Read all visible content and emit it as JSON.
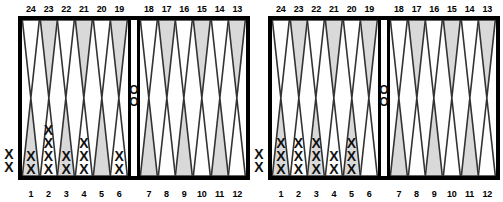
{
  "page": {
    "checker_glyphs": {
      "player_x": "X",
      "player_o": "O"
    },
    "colors": {
      "border": "#000000",
      "background": "#ffffff",
      "point_shaded": "#d9d9d9",
      "point_plain": "#ffffff",
      "point_outline": "#333333",
      "text": "#000000"
    }
  },
  "boards": [
    {
      "id": "board-left",
      "top_numbers": [
        "24",
        "23",
        "22",
        "21",
        "20",
        "19",
        "18",
        "17",
        "16",
        "15",
        "14",
        "13"
      ],
      "bottom_numbers": [
        "1",
        "2",
        "3",
        "4",
        "5",
        "6",
        "7",
        "8",
        "9",
        "10",
        "11",
        "12"
      ],
      "top_left_quadrant": [
        {
          "point": "24",
          "shaded": false,
          "checkers": 0,
          "player": ""
        },
        {
          "point": "23",
          "shaded": true,
          "checkers": 0,
          "player": ""
        },
        {
          "point": "22",
          "shaded": false,
          "checkers": 0,
          "player": ""
        },
        {
          "point": "21",
          "shaded": true,
          "checkers": 0,
          "player": ""
        },
        {
          "point": "20",
          "shaded": false,
          "checkers": 0,
          "player": ""
        },
        {
          "point": "19",
          "shaded": true,
          "checkers": 0,
          "player": ""
        }
      ],
      "top_right_quadrant": [
        {
          "point": "18",
          "shaded": false,
          "checkers": 0,
          "player": ""
        },
        {
          "point": "17",
          "shaded": true,
          "checkers": 0,
          "player": ""
        },
        {
          "point": "16",
          "shaded": false,
          "checkers": 0,
          "player": ""
        },
        {
          "point": "15",
          "shaded": true,
          "checkers": 0,
          "player": ""
        },
        {
          "point": "14",
          "shaded": false,
          "checkers": 0,
          "player": ""
        },
        {
          "point": "13",
          "shaded": true,
          "checkers": 0,
          "player": ""
        }
      ],
      "bottom_left_quadrant": [
        {
          "point": "1",
          "shaded": true,
          "checkers": 2,
          "player": "X"
        },
        {
          "point": "2",
          "shaded": false,
          "checkers": 4,
          "player": "X"
        },
        {
          "point": "3",
          "shaded": true,
          "checkers": 2,
          "player": "X"
        },
        {
          "point": "4",
          "shaded": false,
          "checkers": 3,
          "player": "X"
        },
        {
          "point": "5",
          "shaded": true,
          "checkers": 0,
          "player": ""
        },
        {
          "point": "6",
          "shaded": false,
          "checkers": 2,
          "player": "X"
        }
      ],
      "bottom_right_quadrant": [
        {
          "point": "7",
          "shaded": true,
          "checkers": 0,
          "player": ""
        },
        {
          "point": "8",
          "shaded": false,
          "checkers": 0,
          "player": ""
        },
        {
          "point": "9",
          "shaded": true,
          "checkers": 0,
          "player": ""
        },
        {
          "point": "10",
          "shaded": false,
          "checkers": 0,
          "player": ""
        },
        {
          "point": "11",
          "shaded": true,
          "checkers": 0,
          "player": ""
        },
        {
          "point": "12",
          "shaded": false,
          "checkers": 0,
          "player": ""
        }
      ],
      "bar": {
        "player": "O",
        "checkers": 2
      },
      "borne_off": {
        "player": "X",
        "checkers": 2
      }
    },
    {
      "id": "board-right",
      "top_numbers": [
        "24",
        "23",
        "22",
        "21",
        "20",
        "19",
        "18",
        "17",
        "16",
        "15",
        "14",
        "13"
      ],
      "bottom_numbers": [
        "1",
        "2",
        "3",
        "4",
        "5",
        "6",
        "7",
        "8",
        "9",
        "10",
        "11",
        "12"
      ],
      "top_left_quadrant": [
        {
          "point": "24",
          "shaded": false,
          "checkers": 0,
          "player": ""
        },
        {
          "point": "23",
          "shaded": true,
          "checkers": 0,
          "player": ""
        },
        {
          "point": "22",
          "shaded": false,
          "checkers": 0,
          "player": ""
        },
        {
          "point": "21",
          "shaded": true,
          "checkers": 0,
          "player": ""
        },
        {
          "point": "20",
          "shaded": false,
          "checkers": 0,
          "player": ""
        },
        {
          "point": "19",
          "shaded": true,
          "checkers": 0,
          "player": ""
        }
      ],
      "top_right_quadrant": [
        {
          "point": "18",
          "shaded": false,
          "checkers": 0,
          "player": ""
        },
        {
          "point": "17",
          "shaded": true,
          "checkers": 0,
          "player": ""
        },
        {
          "point": "16",
          "shaded": false,
          "checkers": 0,
          "player": ""
        },
        {
          "point": "15",
          "shaded": true,
          "checkers": 0,
          "player": ""
        },
        {
          "point": "14",
          "shaded": false,
          "checkers": 0,
          "player": ""
        },
        {
          "point": "13",
          "shaded": true,
          "checkers": 0,
          "player": ""
        }
      ],
      "bottom_left_quadrant": [
        {
          "point": "1",
          "shaded": true,
          "checkers": 3,
          "player": "X"
        },
        {
          "point": "2",
          "shaded": false,
          "checkers": 3,
          "player": "X"
        },
        {
          "point": "3",
          "shaded": true,
          "checkers": 3,
          "player": "X"
        },
        {
          "point": "4",
          "shaded": false,
          "checkers": 2,
          "player": "X"
        },
        {
          "point": "5",
          "shaded": true,
          "checkers": 3,
          "player": "X"
        },
        {
          "point": "6",
          "shaded": false,
          "checkers": 0,
          "player": ""
        }
      ],
      "bottom_right_quadrant": [
        {
          "point": "7",
          "shaded": true,
          "checkers": 0,
          "player": ""
        },
        {
          "point": "8",
          "shaded": false,
          "checkers": 0,
          "player": ""
        },
        {
          "point": "9",
          "shaded": true,
          "checkers": 0,
          "player": ""
        },
        {
          "point": "10",
          "shaded": false,
          "checkers": 0,
          "player": ""
        },
        {
          "point": "11",
          "shaded": true,
          "checkers": 0,
          "player": ""
        },
        {
          "point": "12",
          "shaded": false,
          "checkers": 0,
          "player": ""
        }
      ],
      "bar": {
        "player": "O",
        "checkers": 2
      },
      "borne_off": {
        "player": "X",
        "checkers": 2
      }
    }
  ]
}
